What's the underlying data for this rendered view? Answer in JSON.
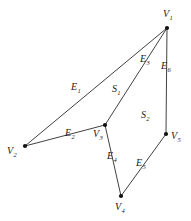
{
  "figure": {
    "type": "graph-diagram",
    "background_color": "#ffffff",
    "stroke_color": "#2b2b2b",
    "vertex_color": "#111111",
    "label_color": "#1a1a1a"
  },
  "vertices": [
    {
      "id": "V1",
      "base": "V",
      "sub": "1",
      "x": 167,
      "y": 28,
      "label_x": 163,
      "label_y": 9
    },
    {
      "id": "V2",
      "base": "V",
      "sub": "2",
      "x": 25,
      "y": 146,
      "label_x": 7,
      "label_y": 146
    },
    {
      "id": "V3",
      "base": "V",
      "sub": "3",
      "x": 105,
      "y": 125,
      "label_x": 93,
      "label_y": 129
    },
    {
      "id": "V4",
      "base": "V",
      "sub": "4",
      "x": 121,
      "y": 196,
      "label_x": 115,
      "label_y": 202
    },
    {
      "id": "V5",
      "base": "V",
      "sub": "5",
      "x": 166,
      "y": 134,
      "label_x": 171,
      "label_y": 131
    }
  ],
  "edges": [
    {
      "id": "E1",
      "base": "E",
      "sub": "1",
      "from": "V2",
      "to": "V1",
      "label_x": 71,
      "label_y": 82
    },
    {
      "id": "E2",
      "base": "E",
      "sub": "2",
      "from": "V2",
      "to": "V3",
      "label_x": 65,
      "label_y": 128
    },
    {
      "id": "E3",
      "base": "E",
      "sub": "3",
      "from": "V3",
      "to": "V1",
      "label_x": 140,
      "label_y": 54
    },
    {
      "id": "E4",
      "base": "E",
      "sub": "4",
      "from": "V3",
      "to": "V4",
      "label_x": 107,
      "label_y": 151
    },
    {
      "id": "E5",
      "base": "E",
      "sub": "5",
      "from": "V4",
      "to": "V5",
      "label_x": 136,
      "label_y": 158
    },
    {
      "id": "E6",
      "base": "E",
      "sub": "6",
      "from": "V1",
      "to": "V5",
      "label_x": 161,
      "label_y": 61
    }
  ],
  "surfaces": [
    {
      "id": "S1",
      "base": "S",
      "sub": "1",
      "label_x": 112,
      "label_y": 84
    },
    {
      "id": "S2",
      "base": "S",
      "sub": "2",
      "label_x": 141,
      "label_y": 110
    }
  ]
}
